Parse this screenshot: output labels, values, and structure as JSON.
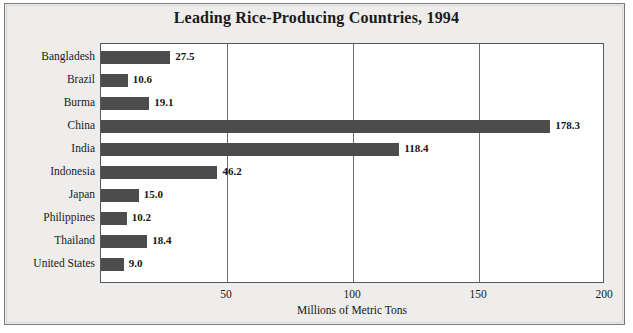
{
  "chart_data": {
    "type": "bar",
    "orientation": "horizontal",
    "title": "Leading Rice-Producing Countries, 1994",
    "xlabel": "Millions of Metric Tons",
    "ylabel": "",
    "xlim": [
      0,
      200
    ],
    "xticks": [
      50,
      100,
      150,
      200
    ],
    "grid": true,
    "legend": null,
    "categories": [
      "Bangladesh",
      "Brazil",
      "Burma",
      "China",
      "India",
      "Indonesia",
      "Japan",
      "Philippines",
      "Thailand",
      "United States"
    ],
    "values": [
      27.5,
      10.6,
      19.1,
      178.3,
      118.4,
      46.2,
      15.0,
      10.2,
      18.4,
      9.0
    ],
    "value_labels": [
      "27.5",
      "10.6",
      "19.1",
      "178.3",
      "118.4",
      "46.2",
      "15.0",
      "10.2",
      "18.4",
      "9.0"
    ],
    "bar_color": "#4c4c4c",
    "plot_background": "#ffffff",
    "page_background": "#eeedeb",
    "axis_color": "#58585a"
  }
}
